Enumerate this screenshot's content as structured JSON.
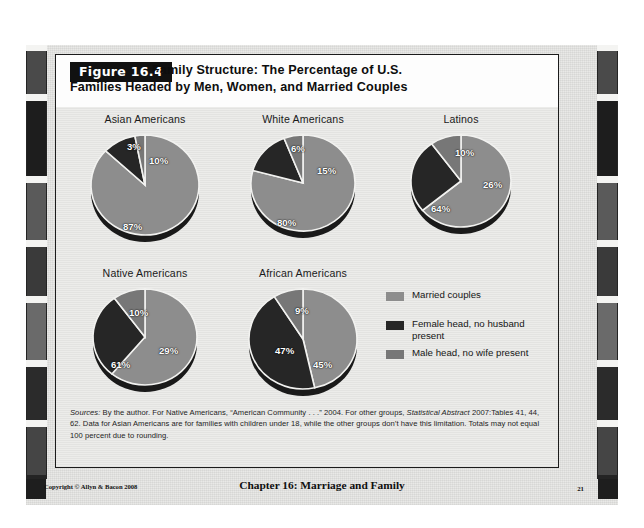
{
  "figure": {
    "badge": "Figure 16.4",
    "title_line1": "Family Structure: The Percentage of U.S.",
    "title_line2": "Families Headed by Men, Women, and Married Couples"
  },
  "legend": {
    "items": [
      {
        "label": "Married couples",
        "color": "#8d8d8d"
      },
      {
        "label": "Female head, no husband present",
        "color": "#262626"
      },
      {
        "label": "Male head, no wife present",
        "color": "#777777"
      }
    ]
  },
  "source": {
    "label": "Sources:",
    "line1": " By the author. For Native Americans, “American Community . . .” 2004. For other groups, ",
    "italic1": "Statistical Abstract",
    "line2": "2007:Tables 41, 44, 62. Data for Asian Americans are for families with children under 18, while the other groups don’t",
    "line3": "have this limitation. Totals may not equal 100 percent due to rounding."
  },
  "footer": {
    "copyright": "Copyright © Allyn & Bacon 2008",
    "chapter": "Chapter 16: Marriage and Family",
    "page": "21"
  },
  "chart_data": {
    "type": "pie",
    "title": "Family Structure: The Percentage of U.S. Families Headed by Men, Women, and Married Couples",
    "unit": "percent",
    "series_names": [
      "Married couples",
      "Female head, no husband present",
      "Male head, no wife present"
    ],
    "series_colors": [
      "#8d8d8d",
      "#262626",
      "#777777"
    ],
    "legend_position": "right-middle",
    "charts": [
      {
        "title": "Asian Americans",
        "labels": [
          "87%",
          "10%",
          "3%"
        ],
        "values": [
          87,
          10,
          3
        ]
      },
      {
        "title": "White Americans",
        "labels": [
          "80%",
          "15%",
          "6%"
        ],
        "values": [
          80,
          15,
          6
        ]
      },
      {
        "title": "Latinos",
        "labels": [
          "64%",
          "26%",
          "10%"
        ],
        "values": [
          64,
          26,
          10
        ]
      },
      {
        "title": "Native Americans",
        "labels": [
          "61%",
          "29%",
          "10%"
        ],
        "values": [
          61,
          29,
          10
        ]
      },
      {
        "title": "African Americans",
        "labels": [
          "47%",
          "45%",
          "9%"
        ],
        "values": [
          47,
          45,
          9
        ]
      }
    ]
  }
}
